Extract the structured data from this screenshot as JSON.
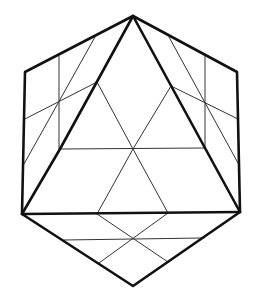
{
  "diagram": {
    "type": "geometric-line-drawing",
    "colors": {
      "background": "#ffffff",
      "line": "#111111",
      "thin_line": "#333333"
    },
    "vertices": {
      "top": [
        133,
        16
      ],
      "upper_left": [
        25,
        72
      ],
      "lower_left": [
        22,
        214
      ],
      "upper_right": [
        237,
        72
      ],
      "lower_right": [
        240,
        212
      ],
      "bottom": [
        133,
        286
      ],
      "tri_base_left": [
        60,
        149
      ],
      "tri_base_right": [
        205,
        148
      ],
      "tri_base_mid": [
        133,
        149
      ],
      "tri_mid_left": [
        97,
        82
      ],
      "tri_mid_right": [
        171,
        86
      ],
      "base_mid_left": [
        97,
        214
      ],
      "base_mid_right": [
        168,
        213
      ],
      "base_cross": [
        133,
        239
      ]
    }
  }
}
